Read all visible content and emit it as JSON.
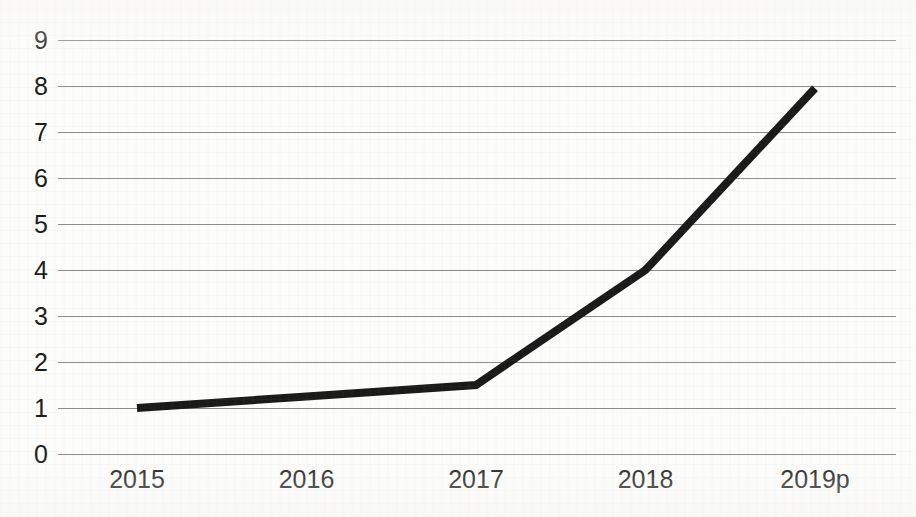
{
  "chart_data": {
    "type": "line",
    "title": "",
    "title_note": "title is cropped off the top edge of the screenshot; only glyph descenders are visible",
    "xlabel": "",
    "ylabel": "",
    "categories": [
      "2015",
      "2016",
      "2017",
      "2018",
      "2019p"
    ],
    "values": [
      1,
      1.25,
      1.5,
      4,
      7.95
    ],
    "series": [
      {
        "name": "",
        "values": [
          1,
          1.25,
          1.5,
          4,
          7.95
        ]
      }
    ],
    "ylim": [
      0,
      9
    ],
    "y_ticks": [
      0,
      1,
      2,
      3,
      4,
      5,
      6,
      7,
      8,
      9
    ],
    "y_tick_labels": [
      "0",
      "1",
      "2",
      "3",
      "4",
      "5",
      "6",
      "7",
      "8",
      "9"
    ],
    "grid": true,
    "grid_axis": "y",
    "legend": false,
    "legend_position": "none",
    "markers": false,
    "line_color": "#1a1a1a",
    "line_width": 8,
    "grid_color": "#8d8d8b",
    "background_color": "#fdfdfc",
    "text_color": "#1b1b1a"
  }
}
